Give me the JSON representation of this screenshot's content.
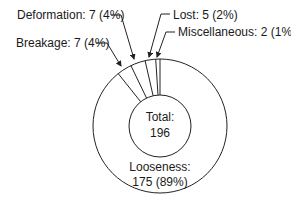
{
  "chart_data": {
    "type": "pie",
    "subtype": "donut",
    "title": "",
    "center_label": {
      "line1": "Total:",
      "line2": "196"
    },
    "total": 196,
    "start": "12 o'clock, small slices counterclockwise",
    "slices": [
      {
        "name": "Miscellaneous",
        "value": 2,
        "percent": 1,
        "label": "Miscellaneous: 2 (1%)"
      },
      {
        "name": "Lost",
        "value": 5,
        "percent": 2,
        "label": "Lost: 5 (2%)"
      },
      {
        "name": "Deformation",
        "value": 7,
        "percent": 4,
        "label": "Deformation: 7 (4%)"
      },
      {
        "name": "Breakage",
        "value": 7,
        "percent": 4,
        "label": "Breakage: 7 (4%)"
      },
      {
        "name": "Looseness",
        "value": 175,
        "percent": 89,
        "label_line1": "Looseness:",
        "label_line2": "175 (89%)"
      }
    ],
    "colors": {
      "stroke": "#222222",
      "fill": "#ffffff",
      "text": "#1a1a1a"
    }
  }
}
